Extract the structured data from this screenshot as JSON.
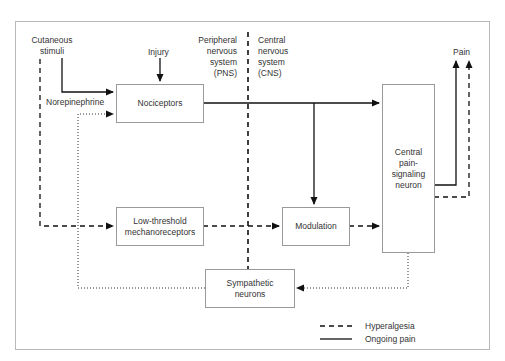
{
  "diagram": {
    "title": "",
    "labels": {
      "cutaneous_stimuli_1": "Cutaneous",
      "cutaneous_stimuli_2": "stimuli",
      "injury": "Injury",
      "norepinephrine": "Norepinephrine",
      "pns_1": "Peripheral",
      "pns_2": "nervous",
      "pns_3": "system",
      "pns_4": "(PNS)",
      "cns_1": "Central",
      "cns_2": "nervous",
      "cns_3": "system",
      "cns_4": "(CNS)",
      "pain": "Pain"
    },
    "nodes": {
      "nociceptors": "Nociceptors",
      "low_threshold_1": "Low-threshold",
      "low_threshold_2": "mechanoreceptors",
      "modulation": "Modulation",
      "central_1": "Central",
      "central_2": "pain-",
      "central_3": "signaling",
      "central_4": "neuron",
      "sympathetic_1": "Sympathetic",
      "sympathetic_2": "neurons"
    },
    "legend": {
      "hyperalgesia": "Hyperalgesia",
      "ongoing_pain": "Ongoing pain"
    },
    "edges": [
      {
        "from": "Cutaneous stimuli",
        "to": "Nociceptors",
        "style": "solid"
      },
      {
        "from": "Injury",
        "to": "Nociceptors",
        "style": "solid"
      },
      {
        "from": "Sympathetic neurons (Norepinephrine)",
        "to": "Nociceptors",
        "style": "dotted"
      },
      {
        "from": "Cutaneous stimuli",
        "to": "Low-threshold mechanoreceptors",
        "style": "dashed"
      },
      {
        "from": "Nociceptors",
        "to": "Central pain-signaling neuron",
        "style": "solid"
      },
      {
        "from": "Nociceptors",
        "to": "Modulation",
        "style": "solid"
      },
      {
        "from": "Low-threshold mechanoreceptors",
        "to": "Modulation",
        "style": "dashed"
      },
      {
        "from": "Modulation",
        "to": "Central pain-signaling neuron",
        "style": "dashed"
      },
      {
        "from": "Central pain-signaling neuron",
        "to": "Pain",
        "style": "solid"
      },
      {
        "from": "Central pain-signaling neuron",
        "to": "Pain",
        "style": "dashed"
      },
      {
        "from": "Central pain-signaling neuron",
        "to": "Sympathetic neurons",
        "style": "dotted"
      }
    ]
  }
}
